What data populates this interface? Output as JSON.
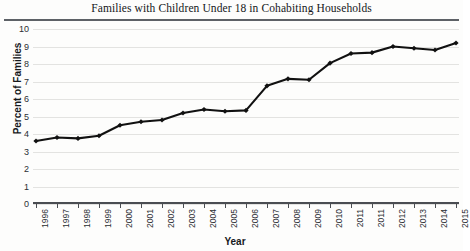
{
  "chart_data": {
    "type": "line",
    "title": "Families with Children Under 18 in Cohabiting Households",
    "xlabel": "Year",
    "ylabel": "Percent of Families",
    "categories": [
      "1996",
      "1997",
      "1998",
      "1999",
      "2000",
      "2001",
      "2002",
      "2003",
      "2004",
      "2005",
      "2006",
      "2007",
      "2008",
      "2009",
      "2010",
      "2011",
      "2011",
      "2012",
      "2013",
      "2014",
      "2015"
    ],
    "values": [
      3.6,
      3.8,
      3.75,
      3.9,
      4.5,
      4.7,
      4.8,
      5.2,
      5.4,
      5.3,
      5.35,
      6.75,
      7.15,
      7.1,
      8.05,
      8.6,
      8.65,
      9.0,
      8.9,
      8.8,
      9.2
    ],
    "ylim": [
      0,
      10
    ],
    "yticks": [
      0,
      1,
      2,
      3,
      4,
      5,
      6,
      7,
      8,
      9,
      10
    ],
    "grid": true,
    "legend": false,
    "marker": "diamond",
    "line_color": "#111111",
    "grid_color": "#e3e3e1"
  }
}
